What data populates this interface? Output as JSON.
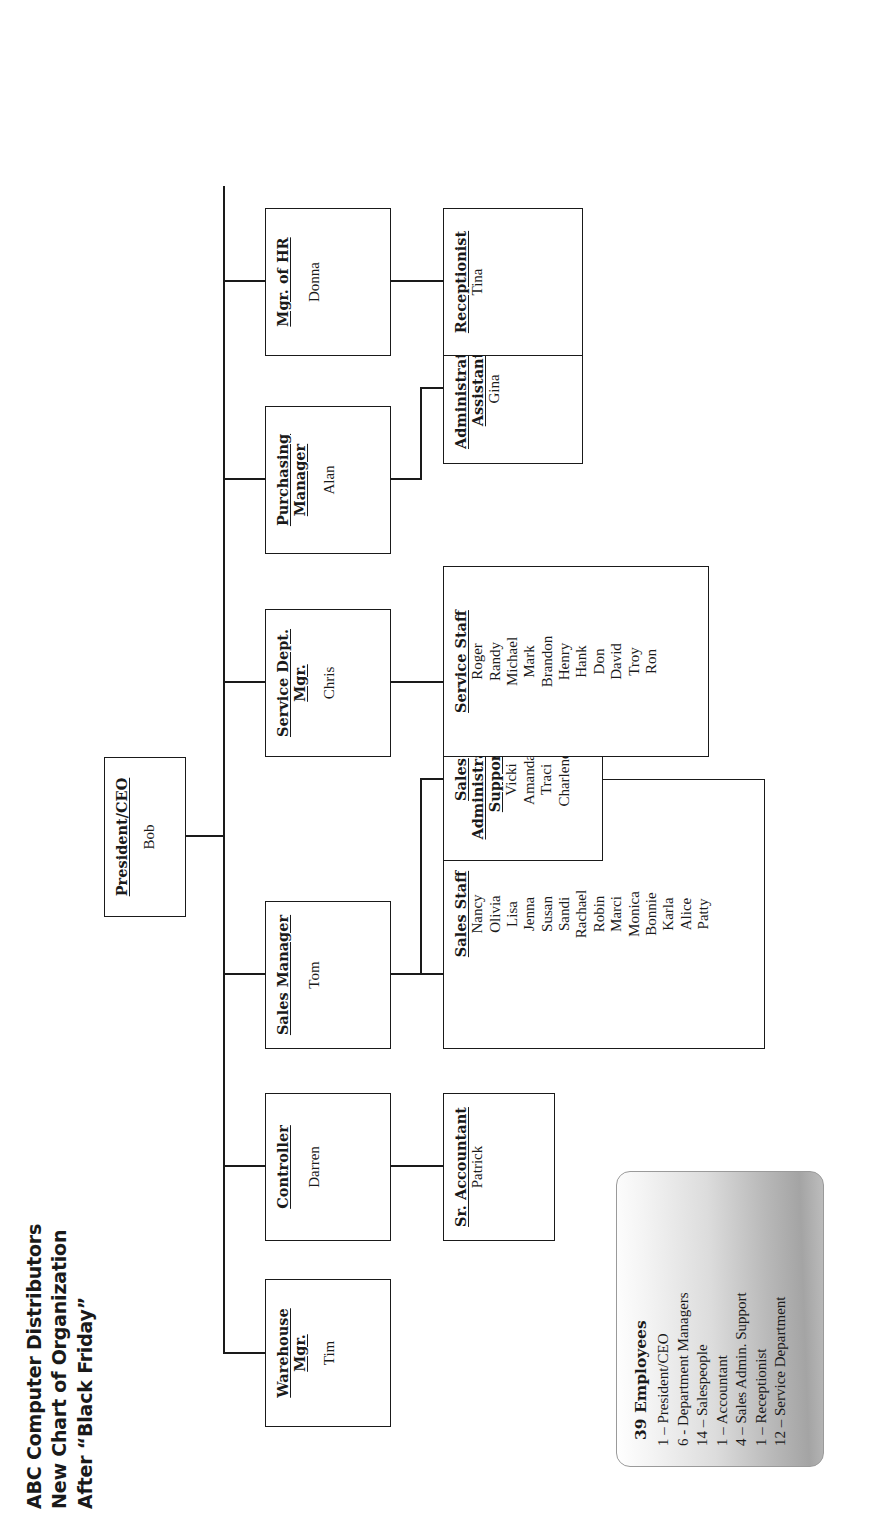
{
  "title": {
    "line1": "ABC Computer Distributors",
    "line2": "New Chart of Organization",
    "line3": "After “Black Friday”"
  },
  "chart": {
    "type": "org-chart",
    "root": {
      "id": "president",
      "header": "President/CEO",
      "name": "Bob"
    },
    "managers": [
      {
        "id": "warehouse-mgr",
        "header_line1": "Warehouse",
        "header_line2": "Mgr.",
        "name": "Tim"
      },
      {
        "id": "controller",
        "header_line1": "Controller",
        "header_line2": "",
        "name": "Darren"
      },
      {
        "id": "sales-manager",
        "header_line1": "Sales Manager",
        "header_line2": "",
        "name": "Tom"
      },
      {
        "id": "service-mgr",
        "header_line1": "Service Dept.",
        "header_line2": "Mgr.",
        "name": "Chris"
      },
      {
        "id": "purchasing-mgr",
        "header_line1": "Purchasing",
        "header_line2": "Manager",
        "name": "Alan"
      },
      {
        "id": "hr-mgr",
        "header_line1": "Mgr. of HR",
        "header_line2": "",
        "name": "Donna"
      }
    ],
    "sub_units": [
      {
        "id": "sr-accountant",
        "parent": "controller",
        "header_line1": "Sr. Accountant",
        "header_line2": "",
        "names": [
          "Patrick"
        ]
      },
      {
        "id": "sales-staff",
        "parent": "sales-manager",
        "header_line1": "Sales Staff",
        "header_line2": "",
        "names": [
          "Nancy",
          "Olivia",
          "Lisa",
          "Jenna",
          "Susan",
          "Sandi",
          "Rachael",
          "Robin",
          "Marci",
          "Monica",
          "Bonnie",
          "Karla",
          "Alice",
          "Patty"
        ]
      },
      {
        "id": "sales-admin-support",
        "parent": "sales-manager",
        "header_line1": "Sales",
        "header_line2": "Administrative",
        "header_line3": "Support",
        "names": [
          "Vicki",
          "Amanda",
          "Traci",
          "Charlene"
        ]
      },
      {
        "id": "service-staff",
        "parent": "service-mgr",
        "header_line1": "Service Staff",
        "header_line2": "",
        "names": [
          "Roger",
          "Randy",
          "Michael",
          "Mark",
          "Brandon",
          "Henry",
          "Hank",
          "Don",
          "David",
          "Troy",
          "Ron"
        ]
      },
      {
        "id": "administrative-assistant",
        "parent": "purchasing-mgr",
        "header_line1": "Administrative",
        "header_line2": "Assistant",
        "names": [
          "Gina"
        ]
      },
      {
        "id": "receptionist",
        "parent": "hr-mgr",
        "header_line1": "Receptionist",
        "header_line2": "",
        "names": [
          "Tina"
        ]
      }
    ]
  },
  "legend": {
    "title": "39  Employees",
    "rows": [
      "1  – President/CEO",
      "6 -  Department Managers",
      "14 – Salespeople",
      "1  – Accountant",
      "4 – Sales Admin. Support",
      "1 – Receptionist",
      "12 – Service Department"
    ]
  },
  "colors": {
    "line": "#1a1a1a",
    "paper": "#ffffff",
    "legend_shade": "#b9b9b9"
  }
}
